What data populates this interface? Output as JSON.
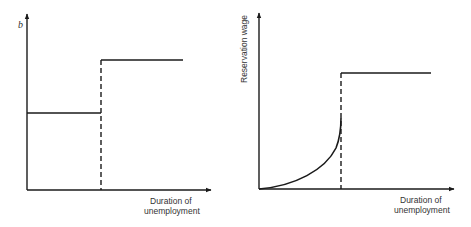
{
  "panels": [
    {
      "id": "left",
      "y_label": "b",
      "x_label_line1": "Duration of",
      "x_label_line2": "unemployment",
      "description": "Unemployment benefit b is constant at a low level, then steps up to a higher constant level at a threshold duration (dashed vertical line)."
    },
    {
      "id": "right",
      "y_label": "Reservation wage",
      "x_label_line1": "Duration of",
      "x_label_line2": "unemployment",
      "description": "Reservation wage rises at an increasing rate up to the threshold duration, then jumps to a higher constant level (dashed vertical line)."
    }
  ]
}
